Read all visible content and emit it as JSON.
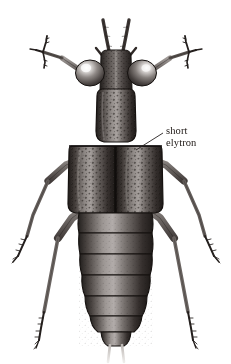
{
  "figure": {
    "background_color": "#ffffff",
    "ink_color": "#2a2422",
    "width": 231,
    "height": 364
  },
  "annotation": {
    "label_line_1": "short",
    "label_line_2": "elytron",
    "text_color": "#1d1714",
    "leader_line": {
      "from_x": 163,
      "from_y": 133,
      "to_x": 136,
      "to_y": 150
    }
  },
  "anatomy": {
    "antennae": "antennae",
    "head": "head",
    "eye_left": "compound-eye-left",
    "eye_right": "compound-eye-right",
    "pronotum": "pronotum",
    "elytra": "short-elytra",
    "elytral_suture": "elytral-suture",
    "abdomen": "abdomen",
    "abdominal_segments": 6,
    "cerci": "cerci",
    "legs": "legs",
    "leg_pairs": 3
  },
  "palette": {
    "body_dark": "#2e2a28",
    "body_mid": "#5d5754",
    "body_light": "#a9a3a0",
    "highlight": "#e9e6e4",
    "eye_dark": "#3a3634",
    "eye_highlight": "#f2f0ee",
    "leg_mid": "#6b6562",
    "cerci": "#d9d5d2",
    "outline": "#171312"
  }
}
